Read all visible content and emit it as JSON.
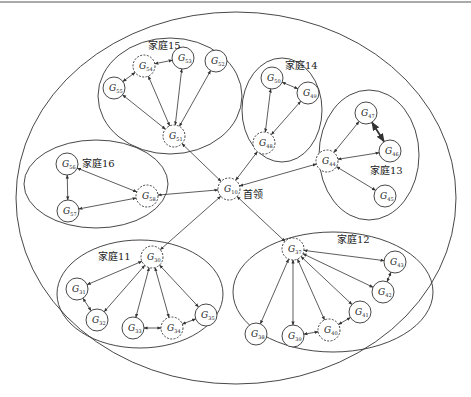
{
  "diagram": {
    "type": "hierarchical-group-network",
    "leader": {
      "id": "G10",
      "base": "G",
      "sub": "10",
      "label": "首领",
      "x": 229,
      "y": 189,
      "dashed": true
    },
    "outer_ellipse": {
      "cx": 236,
      "cy": 198,
      "rx": 220,
      "ry": 186
    },
    "families": [
      {
        "name": "家庭15",
        "label_x": 148,
        "label_y": 49,
        "ellipse": {
          "cx": 170,
          "cy": 96,
          "rx": 72,
          "ry": 58
        },
        "nodes": [
          {
            "id": "G51",
            "sub": "51",
            "x": 174,
            "y": 136,
            "dashed": true
          },
          {
            "id": "G52",
            "sub": "52",
            "x": 216,
            "y": 61,
            "dashed": false
          },
          {
            "id": "G53",
            "sub": "53",
            "x": 183,
            "y": 58,
            "dashed": false
          },
          {
            "id": "G54",
            "sub": "54",
            "x": 144,
            "y": 66,
            "dashed": true
          },
          {
            "id": "G55",
            "sub": "55",
            "x": 114,
            "y": 88,
            "dashed": false
          }
        ],
        "edges": [
          [
            "G55",
            "G54"
          ],
          [
            "G54",
            "G53"
          ],
          [
            "G55",
            "G51"
          ],
          [
            "G54",
            "G51"
          ],
          [
            "G53",
            "G51"
          ],
          [
            "G52",
            "G51"
          ]
        ]
      },
      {
        "name": "家庭14",
        "label_x": 285,
        "label_y": 69,
        "ellipse": {
          "cx": 282,
          "cy": 110,
          "rx": 40,
          "ry": 52
        },
        "nodes": [
          {
            "id": "G50",
            "sub": "50",
            "x": 272,
            "y": 78,
            "dashed": false
          },
          {
            "id": "G49",
            "sub": "49",
            "x": 308,
            "y": 93,
            "dashed": false
          },
          {
            "id": "G48",
            "sub": "48",
            "x": 264,
            "y": 143,
            "dashed": true
          }
        ],
        "edges": [
          [
            "G50",
            "G49"
          ],
          [
            "G50",
            "G48"
          ],
          [
            "G49",
            "G48"
          ]
        ]
      },
      {
        "name": "家庭13",
        "label_x": 370,
        "label_y": 174,
        "ellipse": {
          "cx": 369,
          "cy": 155,
          "rx": 50,
          "ry": 65
        },
        "nodes": [
          {
            "id": "G47",
            "sub": "47",
            "x": 366,
            "y": 113,
            "dashed": false
          },
          {
            "id": "G46",
            "sub": "46",
            "x": 390,
            "y": 151,
            "dashed": false
          },
          {
            "id": "G44",
            "sub": "44",
            "x": 327,
            "y": 161,
            "dashed": true
          },
          {
            "id": "G45",
            "sub": "45",
            "x": 385,
            "y": 196,
            "dashed": false
          }
        ],
        "edges": [
          [
            "G47",
            "G44"
          ],
          [
            "G47",
            "G46",
            "bold"
          ],
          [
            "G46",
            "G44"
          ],
          [
            "G44",
            "G45"
          ]
        ]
      },
      {
        "name": "家庭16",
        "label_x": 82,
        "label_y": 167,
        "ellipse": {
          "cx": 96,
          "cy": 184,
          "rx": 72,
          "ry": 44
        },
        "nodes": [
          {
            "id": "G56",
            "sub": "56",
            "x": 67,
            "y": 164,
            "dashed": false
          },
          {
            "id": "G57",
            "sub": "57",
            "x": 68,
            "y": 211,
            "dashed": false
          },
          {
            "id": "G58",
            "sub": "58",
            "x": 147,
            "y": 196,
            "dashed": true
          }
        ],
        "edges": [
          [
            "G56",
            "G57"
          ],
          [
            "G56",
            "G58"
          ],
          [
            "G57",
            "G58"
          ]
        ]
      },
      {
        "name": "家庭11",
        "label_x": 98,
        "label_y": 260,
        "ellipse": {
          "cx": 140,
          "cy": 294,
          "rx": 83,
          "ry": 54
        },
        "nodes": [
          {
            "id": "G30",
            "sub": "30",
            "x": 152,
            "y": 257,
            "dashed": true
          },
          {
            "id": "G31",
            "sub": "31",
            "x": 77,
            "y": 289,
            "dashed": false
          },
          {
            "id": "G32",
            "sub": "32",
            "x": 97,
            "y": 320,
            "dashed": false
          },
          {
            "id": "G33",
            "sub": "33",
            "x": 133,
            "y": 328,
            "dashed": false
          },
          {
            "id": "G34",
            "sub": "34",
            "x": 172,
            "y": 328,
            "dashed": true
          },
          {
            "id": "G35",
            "sub": "35",
            "x": 206,
            "y": 315,
            "dashed": false
          }
        ],
        "edges": [
          [
            "G30",
            "G31"
          ],
          [
            "G30",
            "G32"
          ],
          [
            "G30",
            "G33"
          ],
          [
            "G30",
            "G34"
          ],
          [
            "G30",
            "G35"
          ],
          [
            "G31",
            "G32"
          ],
          [
            "G33",
            "G34"
          ],
          [
            "G34",
            "G35"
          ]
        ]
      },
      {
        "name": "家庭12",
        "label_x": 337,
        "label_y": 243,
        "ellipse": {
          "cx": 333,
          "cy": 292,
          "rx": 100,
          "ry": 60
        },
        "nodes": [
          {
            "id": "G37",
            "sub": "37",
            "x": 293,
            "y": 249,
            "dashed": true
          },
          {
            "id": "G43",
            "sub": "43",
            "x": 395,
            "y": 262,
            "dashed": false
          },
          {
            "id": "G42",
            "sub": "42",
            "x": 383,
            "y": 292,
            "dashed": false
          },
          {
            "id": "G41",
            "sub": "41",
            "x": 360,
            "y": 312,
            "dashed": false
          },
          {
            "id": "G40",
            "sub": "40",
            "x": 329,
            "y": 330,
            "dashed": true
          },
          {
            "id": "G39",
            "sub": "39",
            "x": 293,
            "y": 336,
            "dashed": false
          },
          {
            "id": "G38",
            "sub": "38",
            "x": 256,
            "y": 334,
            "dashed": false
          }
        ],
        "edges": [
          [
            "G37",
            "G43"
          ],
          [
            "G37",
            "G42"
          ],
          [
            "G37",
            "G41"
          ],
          [
            "G37",
            "G40"
          ],
          [
            "G37",
            "G39"
          ],
          [
            "G37",
            "G38"
          ],
          [
            "G43",
            "G42"
          ],
          [
            "G39",
            "G40"
          ],
          [
            "G40",
            "G41"
          ]
        ]
      }
    ],
    "leader_edges": [
      [
        "G10",
        "G51"
      ],
      [
        "G10",
        "G48"
      ],
      [
        "G10",
        "G44"
      ],
      [
        "G10",
        "G58"
      ],
      [
        "G10",
        "G30"
      ],
      [
        "G10",
        "G37"
      ]
    ],
    "node_radius": 11,
    "colors": {
      "stroke": "#333333",
      "background": "#ffffff",
      "text": "#222222"
    }
  }
}
